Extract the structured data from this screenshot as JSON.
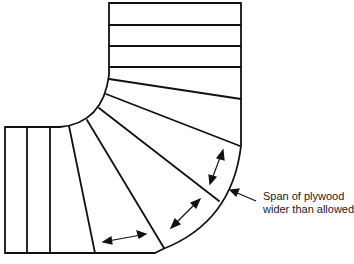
{
  "diagram": {
    "type": "winding-stair-plan",
    "stroke_color": "#111111",
    "background": "#ffffff",
    "annotation": {
      "line1": "Span of plywood",
      "line2": "wider than allowed"
    }
  }
}
